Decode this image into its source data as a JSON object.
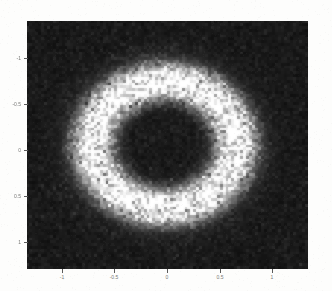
{
  "figure": {
    "title": "",
    "background_color": "#fdfdfc",
    "plot_background_color": "#050505"
  },
  "axes": {
    "x_tick_labels": [
      "-1",
      "-0.5",
      "0",
      "0.5",
      "1"
    ],
    "y_tick_labels": [
      "-1",
      "-0.5",
      "0",
      "0.5",
      "1"
    ],
    "x_tick_values": [
      -1,
      -0.5,
      0,
      0.5,
      1
    ],
    "y_tick_values": [
      -1,
      -0.5,
      0,
      0.5,
      1
    ],
    "xlabel": "",
    "ylabel": "",
    "tick_color": "#7a7a78"
  },
  "chart_data": {
    "type": "heatmap",
    "title": "",
    "xlabel": "",
    "ylabel": "",
    "xlim": [
      -1.2,
      1.2
    ],
    "ylim": [
      -1.2,
      1.2
    ],
    "xticks": [
      -1,
      -0.5,
      0,
      0.5,
      1
    ],
    "yticks": [
      -1,
      -0.5,
      0,
      0.5,
      1
    ],
    "xticklabels": [
      "-1",
      "-0.5",
      "0",
      "0.5",
      "1"
    ],
    "yticklabels": [
      "-1",
      "-0.5",
      "0",
      "0.5",
      "1"
    ],
    "grid": false,
    "legend": "none",
    "colormap": "gray",
    "colormap_low": "#000000",
    "colormap_high": "#ffffff",
    "bins_x": 96,
    "bins_y": 88,
    "structure": "annulus",
    "center": [
      -0.02,
      0.0
    ],
    "ring_radius": 0.62,
    "ring_halfwidth": 0.17,
    "ring_peak_intensity": 1.0,
    "inner_hole_intensity": 0.04,
    "background_intensity": 0.05,
    "noise_level": 0.3,
    "radial_profile": {
      "r": [
        0.0,
        0.1,
        0.2,
        0.3,
        0.35,
        0.4,
        0.45,
        0.5,
        0.55,
        0.6,
        0.65,
        0.7,
        0.75,
        0.8,
        0.85,
        0.9,
        1.0,
        1.1,
        1.2
      ],
      "intensity": [
        0.04,
        0.04,
        0.04,
        0.05,
        0.09,
        0.22,
        0.48,
        0.76,
        0.93,
        1.0,
        0.96,
        0.84,
        0.6,
        0.33,
        0.15,
        0.08,
        0.05,
        0.04,
        0.04
      ]
    }
  }
}
